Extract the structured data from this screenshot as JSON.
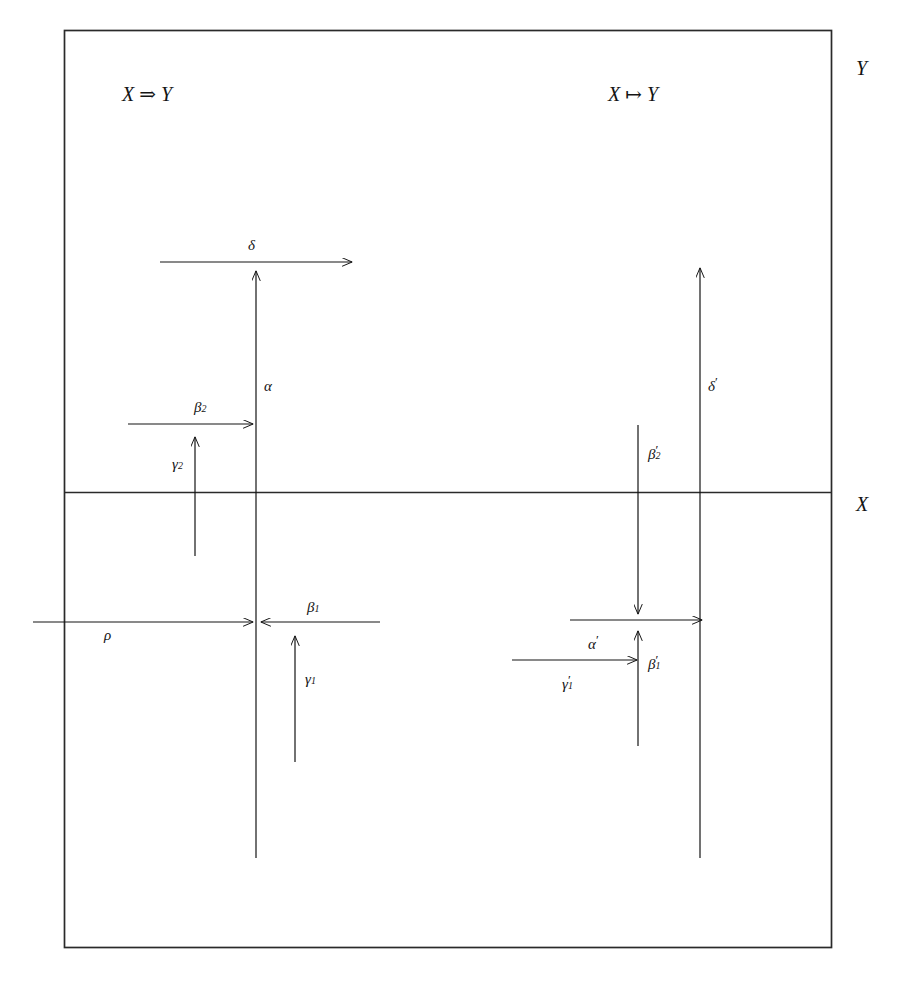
{
  "figure": {
    "frame": {
      "left": 64,
      "top": 30,
      "right": 832,
      "bottom": 948,
      "divider_y": 492,
      "stroke": "#2a2a2a"
    },
    "region_labels": [
      {
        "name": "region-label-y",
        "text": "Y",
        "x": 856,
        "y": 58
      },
      {
        "name": "region-label-x",
        "text": "X",
        "x": 856,
        "y": 494
      }
    ],
    "headers": [
      {
        "name": "header-left",
        "text": "X ⇒ Y",
        "x": 122,
        "y": 84
      },
      {
        "name": "header-right",
        "text": "X ↦ Y",
        "x": 608,
        "y": 84
      }
    ],
    "arrows": {
      "delta": {
        "label": "δ",
        "label_x": 248,
        "label_y": 238,
        "x1": 160,
        "y1": 262,
        "x2": 352,
        "y2": 262,
        "head": "end"
      },
      "alpha": {
        "label": "α",
        "label_x": 264,
        "label_y": 379,
        "x1": 256,
        "y1": 858,
        "x2": 256,
        "y2": 271,
        "head": "end"
      },
      "beta2": {
        "label": "β",
        "sub": "2",
        "label_x": 194,
        "label_y": 400,
        "x1": 128,
        "y1": 424,
        "x2": 253,
        "y2": 424,
        "head": "end"
      },
      "gamma2": {
        "label": "γ",
        "sub": "2",
        "label_x": 172,
        "label_y": 457,
        "x1": 195,
        "y1": 556,
        "x2": 195,
        "y2": 437,
        "head": "end"
      },
      "rho": {
        "label": "ρ",
        "label_x": 104,
        "label_y": 628,
        "x1": 33,
        "y1": 622,
        "x2": 253,
        "y2": 622,
        "head": "end"
      },
      "beta1": {
        "label": "β",
        "sub": "1",
        "label_x": 307,
        "label_y": 600,
        "x1": 380,
        "y1": 622,
        "x2": 261,
        "y2": 622,
        "head": "end"
      },
      "gamma1": {
        "label": "γ",
        "sub": "1",
        "label_x": 305,
        "label_y": 672,
        "x1": 295,
        "y1": 762,
        "x2": 295,
        "y2": 636,
        "head": "end"
      },
      "delta_p": {
        "label": "δ",
        "prime": "′",
        "label_x": 708,
        "label_y": 379,
        "x1": 700,
        "y1": 858,
        "x2": 700,
        "y2": 268,
        "head": "end"
      },
      "beta2_p": {
        "label": "β",
        "sub": "2",
        "prime": "′",
        "label_x": 648,
        "label_y": 447,
        "x1": 638,
        "y1": 425,
        "x2": 638,
        "y2": 622,
        "head": "end"
      },
      "alpha_p": {
        "label": "α",
        "prime": "′",
        "label_x": 588,
        "label_y": 637,
        "x1": 570,
        "y1": 620,
        "x2": 702,
        "y2": 620,
        "head": "end"
      },
      "beta1_p": {
        "label": "β",
        "sub": "1",
        "prime": "′",
        "label_x": 648,
        "label_y": 657,
        "x1": 638,
        "y1": 746,
        "x2": 638,
        "y2": 631,
        "head": "end"
      },
      "gamma1_p": {
        "label": "γ",
        "sub": "1",
        "prime": "′",
        "label_x": 562,
        "label_y": 677,
        "x1": 512,
        "y1": 660,
        "x2": 637,
        "y2": 660,
        "head": "end"
      }
    }
  }
}
